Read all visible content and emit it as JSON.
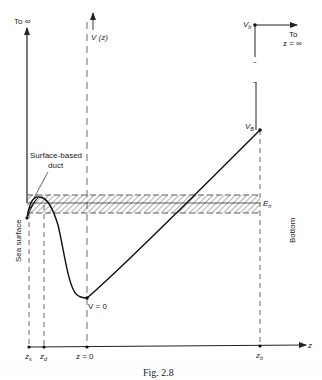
{
  "figure": {
    "caption": "Fig. 2.8",
    "labels": {
      "to_infinity": "To ∞",
      "v_of_z": "V (z)",
      "v_b_top": "V",
      "v_b_top_sub": "b",
      "to_z_inf_line1": "To",
      "to_z_inf_line2": "z = ∞",
      "v_B": "V",
      "v_B_sub": "B",
      "surface_duct_line1": "Surface-based",
      "surface_duct_line2": "duct",
      "e_n": "E",
      "e_n_sub": "n",
      "sea_surface": "Sea surface",
      "bottom": "Bottom",
      "v_zero": "V = 0",
      "z_axis": "z",
      "ticks": {
        "z_s": "z",
        "z_s_sub": "s",
        "z_d": "z",
        "z_d_sub": "d",
        "z_zero": "z = 0",
        "z_b": "z",
        "z_b_sub": "b"
      }
    },
    "colors": {
      "ink": "#222222",
      "background": "#ffffff"
    }
  }
}
